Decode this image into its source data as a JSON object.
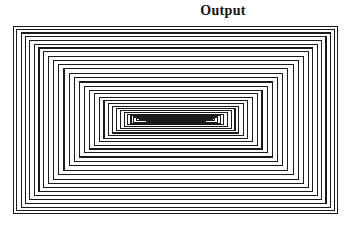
{
  "title": "Output",
  "plot": {
    "x": 13,
    "y": 26,
    "width": 325,
    "height": 188,
    "background": "#ffffff",
    "line_color": "#1a1a1a",
    "line_width": 1.1
  },
  "chart_data": {
    "type": "line",
    "title": "Output",
    "subtitle": "",
    "xlabel": "",
    "ylabel": "",
    "grid": false,
    "legend": null,
    "axis_ranges": {
      "xlim": [
        0,
        1
      ],
      "ylim": [
        0,
        1
      ]
    },
    "focus_point": {
      "x": 0.508,
      "y": 0.51
    },
    "rect_count": 62,
    "contraction_ratio": 0.9,
    "series": [
      {
        "name": "nested-rectangles",
        "note": "Each entry gives normalized [x0, y0, x1, y1] of one rectangle in plot coordinates (0..1, origin top-left).",
        "values": [
          [
            0.0,
            0.0,
            1.0,
            1.0
          ],
          [
            0.012,
            0.018,
            0.988,
            0.982
          ],
          [
            0.025,
            0.037,
            0.976,
            0.963
          ],
          [
            0.038,
            0.056,
            0.963,
            0.943
          ],
          [
            0.052,
            0.076,
            0.95,
            0.923
          ],
          [
            0.066,
            0.096,
            0.936,
            0.903
          ],
          [
            0.08,
            0.117,
            0.922,
            0.882
          ],
          [
            0.095,
            0.138,
            0.908,
            0.86
          ],
          [
            0.11,
            0.16,
            0.893,
            0.838
          ],
          [
            0.125,
            0.182,
            0.878,
            0.815
          ],
          [
            0.141,
            0.205,
            0.862,
            0.792
          ],
          [
            0.157,
            0.228,
            0.846,
            0.768
          ],
          [
            0.173,
            0.252,
            0.83,
            0.744
          ],
          [
            0.189,
            0.275,
            0.814,
            0.72
          ],
          [
            0.205,
            0.298,
            0.798,
            0.697
          ],
          [
            0.221,
            0.32,
            0.782,
            0.675
          ],
          [
            0.236,
            0.341,
            0.766,
            0.654
          ],
          [
            0.251,
            0.361,
            0.751,
            0.634
          ],
          [
            0.266,
            0.379,
            0.736,
            0.616
          ],
          [
            0.28,
            0.396,
            0.722,
            0.599
          ],
          [
            0.294,
            0.412,
            0.708,
            0.583
          ],
          [
            0.307,
            0.426,
            0.695,
            0.569
          ],
          [
            0.319,
            0.439,
            0.683,
            0.556
          ],
          [
            0.331,
            0.45,
            0.671,
            0.545
          ],
          [
            0.342,
            0.46,
            0.66,
            0.535
          ],
          [
            0.353,
            0.469,
            0.649,
            0.526
          ],
          [
            0.363,
            0.477,
            0.639,
            0.518
          ],
          [
            0.372,
            0.484,
            0.63,
            0.511
          ],
          [
            0.381,
            0.49,
            0.621,
            0.505
          ],
          [
            0.389,
            0.495,
            0.613,
            0.5
          ],
          [
            0.397,
            0.5,
            0.605,
            0.496
          ],
          [
            0.404,
            0.504,
            0.598,
            0.492
          ],
          [
            0.411,
            0.507,
            0.591,
            0.489
          ],
          [
            0.417,
            0.51,
            0.585,
            0.486
          ],
          [
            0.423,
            0.512,
            0.579,
            0.484
          ],
          [
            0.429,
            0.514,
            0.573,
            0.482
          ],
          [
            0.434,
            0.516,
            0.568,
            0.48
          ],
          [
            0.439,
            0.518,
            0.563,
            0.479
          ],
          [
            0.443,
            0.519,
            0.559,
            0.478
          ],
          [
            0.447,
            0.52,
            0.555,
            0.477
          ],
          [
            0.451,
            0.521,
            0.551,
            0.476
          ]
        ]
      }
    ]
  }
}
